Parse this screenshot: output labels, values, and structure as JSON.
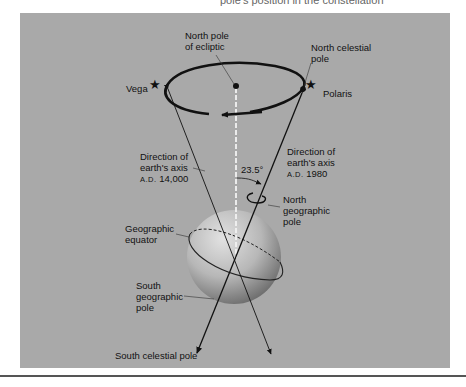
{
  "caption_top": "pole's position in the constellation",
  "diagram": {
    "labels": {
      "north_pole_ecliptic": [
        "North pole",
        "of ecliptic"
      ],
      "north_celestial_pole": [
        "North celestial",
        "pole"
      ],
      "vega": "Vega",
      "polaris": "Polaris",
      "axis_14000": [
        "Direction of",
        "earth's axis",
        "A.D.",
        "14,000"
      ],
      "axis_1980": [
        "Direction of",
        "earth's axis",
        "A.D.",
        "1980"
      ],
      "angle": "23.5°",
      "north_geographic_pole": [
        "North",
        "geographic",
        "pole"
      ],
      "geographic_equator": [
        "Geographic",
        "equator"
      ],
      "south_geographic_pole": [
        "South",
        "geographic",
        "pole"
      ],
      "south_celestial_pole": "South celestial pole"
    },
    "colors": {
      "background": "#a9a9a9",
      "ink": "#111111",
      "sphere_light": "#d8d8d8",
      "sphere_dark": "#6e6e6e"
    }
  }
}
